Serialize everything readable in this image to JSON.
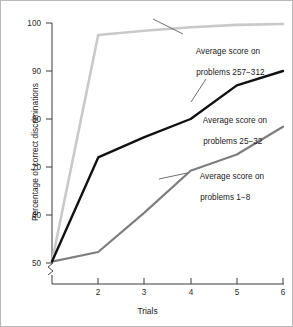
{
  "chart_data": {
    "type": "line",
    "title": "",
    "xlabel": "Trials",
    "ylabel": "Percentage of correct discriminations",
    "x": [
      1,
      2,
      3,
      4,
      5,
      6
    ],
    "xtick_labels": [
      "",
      "2",
      "3",
      "4",
      "5",
      "6"
    ],
    "ytick_labels": [
      "50",
      "60",
      "70",
      "80",
      "90",
      "100"
    ],
    "ytick_values": [
      50,
      60,
      70,
      80,
      90,
      100
    ],
    "ylim": [
      50,
      100
    ],
    "xlim": [
      1,
      6
    ],
    "grid": false,
    "legend": "inline-annotations",
    "axis_break": true,
    "axis_break_note": "zigzag break mark on y-axis below 50",
    "series": [
      {
        "name": "Average score on problems 257−312",
        "color": "#c9c9c9",
        "values": [
          50.3,
          97.5,
          98.4,
          99.1,
          99.6,
          99.8
        ]
      },
      {
        "name": "Average score on problems 25−32",
        "color": "#111111",
        "values": [
          50.3,
          72.0,
          76.2,
          80.0,
          87.0,
          90.0
        ]
      },
      {
        "name": "Average score on problems 1−8",
        "color": "#7e7e7e",
        "values": [
          50.3,
          52.3,
          60.5,
          69.2,
          72.6,
          78.4
        ]
      }
    ],
    "annotations": [
      {
        "id": "anno-257-312",
        "line1": "Average score on",
        "line2": "problems 257−312",
        "x": 186,
        "y": 36
      },
      {
        "id": "anno-25-32",
        "line1": "Average score on",
        "line2": "problems 25−32",
        "x": 193,
        "y": 105
      },
      {
        "id": "anno-1-8",
        "line1": "Average score on",
        "line2": "problems 1−8",
        "x": 190,
        "y": 161
      }
    ]
  },
  "colors": {
    "frame_border": "#b9b9b9",
    "axis": "#3a3a3a",
    "background": "#ffffff",
    "text": "#1a1a1a",
    "leader_line": "#4a4a4a"
  }
}
